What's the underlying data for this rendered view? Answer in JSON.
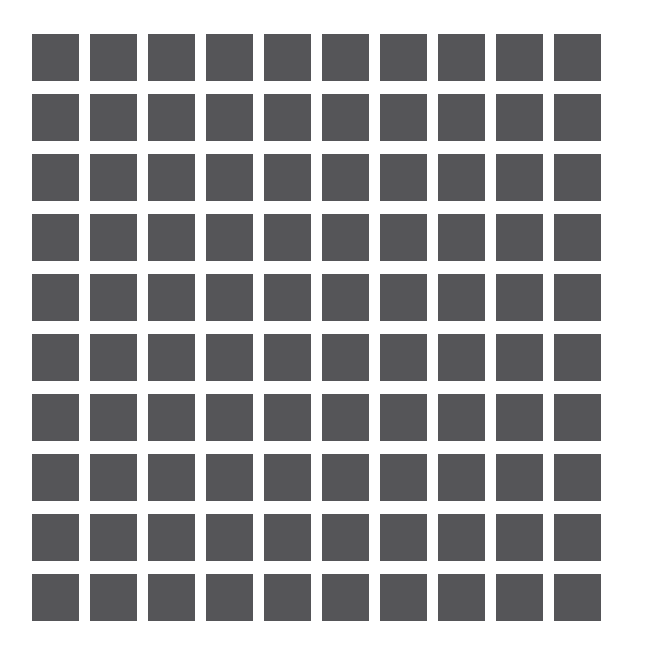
{
  "canvas": {
    "width": 646,
    "height": 666,
    "background_color": "#ffffff"
  },
  "chart_data": {
    "type": "heatmap",
    "title": "",
    "subtitle": "",
    "xlabel": "",
    "ylabel": "",
    "grid": false,
    "legend_position": "none",
    "rows": 10,
    "columns": 10,
    "cell_count": 100,
    "uniform_value": 1,
    "value_color": "#555558",
    "categories": [
      "1",
      "2",
      "3",
      "4",
      "5",
      "6",
      "7",
      "8",
      "9",
      "10"
    ],
    "row_labels": [
      "1",
      "2",
      "3",
      "4",
      "5",
      "6",
      "7",
      "8",
      "9",
      "10"
    ],
    "tick_labels_x": [],
    "tick_labels_y": [],
    "annotations": [],
    "values": [
      [
        1,
        1,
        1,
        1,
        1,
        1,
        1,
        1,
        1,
        1
      ],
      [
        1,
        1,
        1,
        1,
        1,
        1,
        1,
        1,
        1,
        1
      ],
      [
        1,
        1,
        1,
        1,
        1,
        1,
        1,
        1,
        1,
        1
      ],
      [
        1,
        1,
        1,
        1,
        1,
        1,
        1,
        1,
        1,
        1
      ],
      [
        1,
        1,
        1,
        1,
        1,
        1,
        1,
        1,
        1,
        1
      ],
      [
        1,
        1,
        1,
        1,
        1,
        1,
        1,
        1,
        1,
        1
      ],
      [
        1,
        1,
        1,
        1,
        1,
        1,
        1,
        1,
        1,
        1
      ],
      [
        1,
        1,
        1,
        1,
        1,
        1,
        1,
        1,
        1,
        1
      ],
      [
        1,
        1,
        1,
        1,
        1,
        1,
        1,
        1,
        1,
        1
      ],
      [
        1,
        1,
        1,
        1,
        1,
        1,
        1,
        1,
        1,
        1
      ]
    ]
  },
  "layout": {
    "origin_x": 32,
    "origin_y": 34,
    "cell_width": 47,
    "cell_height": 47,
    "pitch_x": 58,
    "pitch_y": 60
  }
}
